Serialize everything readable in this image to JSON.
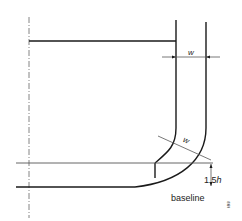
{
  "diagram": {
    "type": "technical-drawing",
    "labels": {
      "w_top": "w",
      "w_diagonal": "w",
      "height_value": "1.5",
      "height_var": "h",
      "baseline": "baseline",
      "figure_id": "0808"
    },
    "colors": {
      "line": "#1a1a1a",
      "thin_line": "#555555",
      "background": "#ffffff"
    }
  }
}
